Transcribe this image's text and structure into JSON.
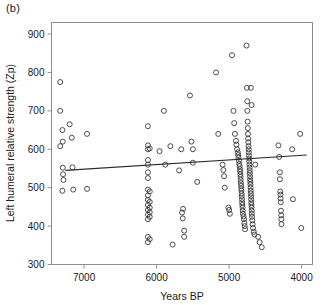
{
  "figure": {
    "panel_label": "(b)"
  },
  "chart_data": {
    "type": "scatter",
    "title": "",
    "panel": "(b)",
    "xlabel": "Years BP",
    "ylabel": "Left humeral relative strength (Zp)",
    "xlim": [
      7450,
      3850
    ],
    "ylim": [
      300,
      930
    ],
    "x_inverted": true,
    "grid": false,
    "legend": null,
    "xticks": [
      7000,
      6000,
      5000,
      4000
    ],
    "xtick_labels": [
      "7000",
      "6000",
      "5000",
      "4000"
    ],
    "yticks": [
      300,
      400,
      500,
      600,
      700,
      800,
      900
    ],
    "ytick_labels": [
      "300",
      "400",
      "500",
      "600",
      "700",
      "800",
      "900"
    ],
    "marker": "open-circle",
    "marker_color": "#3a3a3a",
    "trend_line": {
      "type": "linear-regression",
      "color": "#2b2b2b",
      "x_start": 7260,
      "y_start": 545,
      "x_end": 3930,
      "y_end": 585
    },
    "points": [
      [
        7330,
        775
      ],
      [
        7330,
        700
      ],
      [
        7300,
        650
      ],
      [
        7295,
        620
      ],
      [
        7330,
        608
      ],
      [
        7200,
        665
      ],
      [
        7170,
        630
      ],
      [
        7295,
        552
      ],
      [
        7290,
        535
      ],
      [
        7285,
        520
      ],
      [
        7300,
        492
      ],
      [
        7160,
        553
      ],
      [
        7150,
        495
      ],
      [
        6960,
        640
      ],
      [
        6960,
        497
      ],
      [
        6120,
        660
      ],
      [
        6120,
        610
      ],
      [
        6120,
        600
      ],
      [
        6120,
        572
      ],
      [
        6120,
        560
      ],
      [
        6120,
        540
      ],
      [
        6120,
        525
      ],
      [
        6120,
        495
      ],
      [
        6120,
        480
      ],
      [
        6120,
        468
      ],
      [
        6120,
        455
      ],
      [
        6120,
        442
      ],
      [
        6120,
        430
      ],
      [
        6120,
        418
      ],
      [
        6120,
        372
      ],
      [
        6120,
        358
      ],
      [
        6095,
        602
      ],
      [
        6095,
        490
      ],
      [
        6095,
        463
      ],
      [
        6095,
        448
      ],
      [
        6095,
        436
      ],
      [
        6095,
        424
      ],
      [
        6095,
        366
      ],
      [
        5960,
        595
      ],
      [
        5900,
        700
      ],
      [
        5880,
        560
      ],
      [
        5810,
        608
      ],
      [
        5780,
        352
      ],
      [
        5690,
        545
      ],
      [
        5660,
        600
      ],
      [
        5650,
        435
      ],
      [
        5640,
        420
      ],
      [
        5635,
        445
      ],
      [
        5620,
        388
      ],
      [
        5620,
        372
      ],
      [
        5540,
        740
      ],
      [
        5520,
        620
      ],
      [
        5500,
        600
      ],
      [
        5500,
        565
      ],
      [
        5440,
        515
      ],
      [
        5180,
        800
      ],
      [
        5150,
        640
      ],
      [
        5090,
        560
      ],
      [
        5080,
        546
      ],
      [
        5070,
        530
      ],
      [
        5060,
        500
      ],
      [
        5010,
        448
      ],
      [
        5000,
        442
      ],
      [
        4990,
        432
      ],
      [
        4960,
        845
      ],
      [
        4940,
        700
      ],
      [
        4930,
        668
      ],
      [
        4920,
        640
      ],
      [
        4905,
        622
      ],
      [
        4900,
        612
      ],
      [
        4890,
        600
      ],
      [
        4880,
        592
      ],
      [
        4875,
        585
      ],
      [
        4870,
        578
      ],
      [
        4865,
        570
      ],
      [
        4860,
        562
      ],
      [
        4855,
        556
      ],
      [
        4850,
        548
      ],
      [
        4848,
        542
      ],
      [
        4845,
        535
      ],
      [
        4842,
        528
      ],
      [
        4840,
        520
      ],
      [
        4838,
        512
      ],
      [
        4835,
        505
      ],
      [
        4832,
        498
      ],
      [
        4830,
        492
      ],
      [
        4828,
        485
      ],
      [
        4825,
        478
      ],
      [
        4822,
        470
      ],
      [
        4820,
        462
      ],
      [
        4818,
        455
      ],
      [
        4815,
        448
      ],
      [
        4812,
        440
      ],
      [
        4810,
        432
      ],
      [
        4800,
        425
      ],
      [
        4795,
        418
      ],
      [
        4790,
        408
      ],
      [
        4785,
        400
      ],
      [
        4780,
        392
      ],
      [
        4760,
        870
      ],
      [
        4755,
        760
      ],
      [
        4750,
        725
      ],
      [
        4748,
        700
      ],
      [
        4745,
        672
      ],
      [
        4742,
        655
      ],
      [
        4740,
        640
      ],
      [
        4738,
        628
      ],
      [
        4735,
        618
      ],
      [
        4732,
        608
      ],
      [
        4730,
        600
      ],
      [
        4728,
        592
      ],
      [
        4726,
        584
      ],
      [
        4724,
        576
      ],
      [
        4722,
        568
      ],
      [
        4720,
        560
      ],
      [
        4718,
        552
      ],
      [
        4716,
        545
      ],
      [
        4714,
        538
      ],
      [
        4712,
        530
      ],
      [
        4710,
        522
      ],
      [
        4708,
        515
      ],
      [
        4706,
        508
      ],
      [
        4704,
        500
      ],
      [
        4702,
        492
      ],
      [
        4700,
        485
      ],
      [
        4698,
        478
      ],
      [
        4696,
        470
      ],
      [
        4694,
        462
      ],
      [
        4692,
        455
      ],
      [
        4690,
        448
      ],
      [
        4688,
        440
      ],
      [
        4686,
        432
      ],
      [
        4684,
        424
      ],
      [
        4680,
        415
      ],
      [
        4676,
        405
      ],
      [
        4670,
        395
      ],
      [
        4660,
        385
      ],
      [
        4650,
        378
      ],
      [
        4600,
        372
      ],
      [
        4580,
        358
      ],
      [
        4550,
        345
      ],
      [
        4700,
        760
      ],
      [
        4690,
        715
      ],
      [
        4640,
        560
      ],
      [
        4320,
        610
      ],
      [
        4310,
        580
      ],
      [
        4300,
        540
      ],
      [
        4300,
        522
      ],
      [
        4295,
        490
      ],
      [
        4292,
        482
      ],
      [
        4290,
        472
      ],
      [
        4288,
        462
      ],
      [
        4285,
        440
      ],
      [
        4282,
        428
      ],
      [
        4280,
        418
      ],
      [
        4278,
        405
      ],
      [
        4130,
        600
      ],
      [
        4120,
        470
      ],
      [
        4020,
        640
      ],
      [
        4005,
        395
      ]
    ]
  }
}
